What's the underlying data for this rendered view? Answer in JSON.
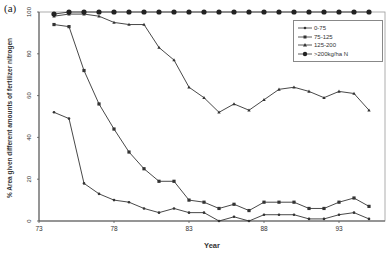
{
  "panel_label": "(a)",
  "chart_data": {
    "type": "line",
    "title": "",
    "xlabel": "Year",
    "ylabel": "% Area given different amounts of fertilizer nitrogen",
    "xlim": [
      73,
      96
    ],
    "ylim": [
      0,
      100
    ],
    "xticks": [
      73,
      78,
      83,
      88,
      93
    ],
    "yticks": [
      0,
      20,
      40,
      60,
      80,
      100
    ],
    "grid": false,
    "legend_position": "upper right (inside)",
    "x": [
      74,
      75,
      76,
      77,
      78,
      79,
      80,
      81,
      82,
      83,
      84,
      85,
      86,
      87,
      88,
      89,
      90,
      91,
      92,
      93,
      94,
      95
    ],
    "series": [
      {
        "name": "0-75",
        "marker": "diamond-small",
        "values": [
          52,
          49,
          18,
          13,
          10,
          9,
          6,
          4,
          6,
          4,
          4,
          0,
          2,
          0,
          3,
          3,
          3,
          1,
          1,
          3,
          4,
          1
        ]
      },
      {
        "name": "75-125",
        "marker": "square",
        "values": [
          94,
          93,
          72,
          56,
          44,
          33,
          25,
          19,
          19,
          10,
          9,
          6,
          8,
          5,
          9,
          9,
          9,
          6,
          6,
          9,
          11,
          7
        ]
      },
      {
        "name": "125-200",
        "marker": "triangle",
        "values": [
          98,
          99,
          99,
          98,
          95,
          94,
          94,
          83,
          77,
          64,
          59,
          52,
          56,
          53,
          58,
          63,
          64,
          62,
          59,
          62,
          61,
          53
        ]
      },
      {
        "name": ">200kg/ha N",
        "marker": "circle-large",
        "values": [
          99,
          100,
          100,
          100,
          100,
          100,
          100,
          100,
          100,
          100,
          100,
          100,
          100,
          100,
          100,
          100,
          100,
          100,
          100,
          100,
          100,
          100
        ]
      }
    ]
  },
  "legend": {
    "items": [
      {
        "label": "0-75"
      },
      {
        "label": "75-125"
      },
      {
        "label": "125-200"
      },
      {
        "label": ">200kg/ha N"
      }
    ]
  },
  "style": {
    "line_color": "#333333",
    "axis_color": "#555555"
  }
}
